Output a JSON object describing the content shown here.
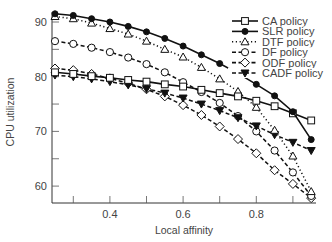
{
  "chart_data": {
    "type": "line",
    "title": "",
    "xlabel": "Local affinity",
    "ylabel": "CPU utilization",
    "xlim": [
      0.25,
      0.97
    ],
    "ylim": [
      57,
      92.5
    ],
    "x_ticks": [
      0.3,
      0.4,
      0.5,
      0.6,
      0.7,
      0.8,
      0.9
    ],
    "x_tick_labels": [
      "0.4",
      "0.6",
      "0.8"
    ],
    "x_tick_label_values": [
      0.4,
      0.6,
      0.8
    ],
    "y_ticks": [
      60,
      65,
      70,
      75,
      80,
      85,
      90
    ],
    "y_tick_labels": [
      "60",
      "70",
      "80",
      "90"
    ],
    "y_tick_label_values": [
      60,
      70,
      80,
      90
    ],
    "grid": false,
    "legend_position": "upper right",
    "x": [
      0.25,
      0.3,
      0.35,
      0.4,
      0.45,
      0.5,
      0.55,
      0.6,
      0.65,
      0.7,
      0.75,
      0.8,
      0.85,
      0.9,
      0.95
    ],
    "series": [
      {
        "name": "CA policy",
        "marker": "square-open",
        "line": "solid",
        "values": [
          80.8,
          80.5,
          80.1,
          79.8,
          79.4,
          79.1,
          78.6,
          78.2,
          77.6,
          77.0,
          76.4,
          75.6,
          74.6,
          73.3,
          72.0
        ]
      },
      {
        "name": "SLR policy",
        "marker": "circle-filled",
        "line": "solid",
        "values": [
          91.5,
          91.2,
          90.6,
          90.0,
          89.2,
          88.2,
          87.0,
          85.6,
          84.0,
          82.4,
          80.6,
          78.6,
          76.5,
          73.6,
          68.5
        ]
      },
      {
        "name": "DTF policy",
        "marker": "triangle-open",
        "line": "dotted",
        "values": [
          91.0,
          90.6,
          89.8,
          88.8,
          87.8,
          86.5,
          85.0,
          83.6,
          81.7,
          79.6,
          77.3,
          74.4,
          70.2,
          65.5,
          59.0
        ]
      },
      {
        "name": "DF policy",
        "marker": "circle-open",
        "line": "dashed",
        "values": [
          86.5,
          86.0,
          85.3,
          84.5,
          83.5,
          82.3,
          80.8,
          79.0,
          77.2,
          75.2,
          72.8,
          70.0,
          66.5,
          62.5,
          58.2
        ]
      },
      {
        "name": "ODF policy",
        "marker": "diamond-open",
        "line": "dashed",
        "values": [
          81.5,
          81.2,
          80.5,
          79.7,
          78.8,
          77.7,
          76.4,
          74.8,
          73.0,
          70.9,
          68.6,
          66.0,
          62.9,
          60.4,
          57.8
        ]
      },
      {
        "name": "CADF policy",
        "marker": "triangle-down-filled",
        "line": "dashed",
        "values": [
          80.3,
          80.0,
          79.6,
          79.1,
          78.5,
          77.8,
          77.0,
          76.1,
          75.0,
          73.8,
          72.5,
          71.0,
          69.4,
          68.0,
          66.5
        ]
      }
    ]
  }
}
